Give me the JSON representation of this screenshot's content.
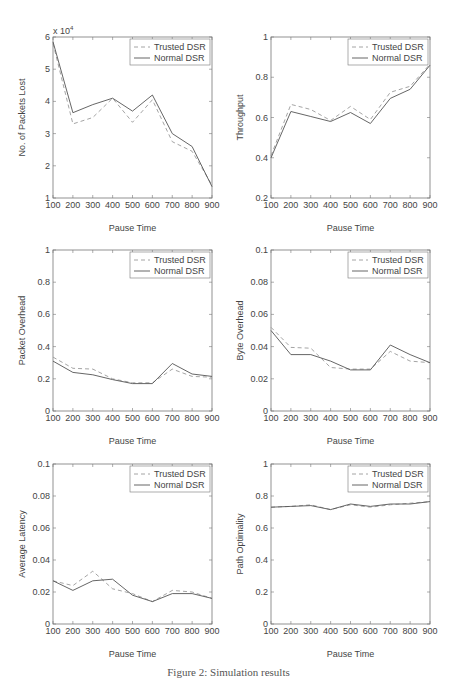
{
  "figure": {
    "caption": "Figure 2: Simulation results"
  },
  "legend": {
    "trusted": "Trusted DSR",
    "normal": "Normal DSR"
  },
  "colors": {
    "trusted": "#9a9a9a",
    "normal": "#555555",
    "axis": "#777777"
  },
  "chart_data": [
    {
      "type": "line",
      "title": "",
      "xlabel": "Pause Time",
      "ylabel": "No. of Packets Lost",
      "y_multiplier_label": "x 10^4",
      "x": [
        100,
        200,
        300,
        400,
        500,
        600,
        700,
        800,
        900
      ],
      "xticks": [
        "100",
        "200",
        "300",
        "400",
        "500",
        "600",
        "700",
        "800",
        "900"
      ],
      "yticks": [
        "1",
        "2",
        "3",
        "4",
        "5",
        "6"
      ],
      "ylim": [
        1,
        6
      ],
      "grid": false,
      "legend_position": "upper right",
      "series": [
        {
          "name": "Trusted DSR",
          "style": "dashed",
          "values": [
            5.8,
            3.3,
            3.5,
            4.1,
            3.35,
            4.05,
            2.75,
            2.45,
            1.4
          ]
        },
        {
          "name": "Normal DSR",
          "style": "solid",
          "values": [
            5.85,
            3.65,
            3.9,
            4.1,
            3.7,
            4.2,
            3.0,
            2.6,
            1.35
          ]
        }
      ]
    },
    {
      "type": "line",
      "title": "",
      "xlabel": "Pause Time",
      "ylabel": "Throughput",
      "x": [
        100,
        200,
        300,
        400,
        500,
        600,
        700,
        800,
        900
      ],
      "xticks": [
        "100",
        "200",
        "300",
        "400",
        "500",
        "600",
        "700",
        "800",
        "900"
      ],
      "yticks": [
        "0.2",
        "0.4",
        "0.6",
        "0.8",
        "1"
      ],
      "ylim": [
        0.2,
        1
      ],
      "grid": false,
      "legend_position": "upper right",
      "series": [
        {
          "name": "Trusted DSR",
          "style": "dashed",
          "values": [
            0.41,
            0.665,
            0.64,
            0.585,
            0.655,
            0.59,
            0.725,
            0.755,
            0.865
          ]
        },
        {
          "name": "Normal DSR",
          "style": "solid",
          "values": [
            0.4,
            0.63,
            0.605,
            0.58,
            0.625,
            0.57,
            0.695,
            0.74,
            0.86
          ]
        }
      ]
    },
    {
      "type": "line",
      "title": "",
      "xlabel": "Pause Time",
      "ylabel": "Packet Overhead",
      "x": [
        100,
        200,
        300,
        400,
        500,
        600,
        700,
        800,
        900
      ],
      "xticks": [
        "100",
        "200",
        "300",
        "400",
        "500",
        "600",
        "700",
        "800",
        "900"
      ],
      "yticks": [
        "0",
        "0.2",
        "0.4",
        "0.6",
        "0.8",
        "1"
      ],
      "ylim": [
        0,
        1
      ],
      "grid": false,
      "legend_position": "upper right",
      "series": [
        {
          "name": "Trusted DSR",
          "style": "dashed",
          "values": [
            0.335,
            0.265,
            0.26,
            0.2,
            0.175,
            0.175,
            0.26,
            0.215,
            0.21
          ]
        },
        {
          "name": "Normal DSR",
          "style": "solid",
          "values": [
            0.31,
            0.24,
            0.225,
            0.195,
            0.17,
            0.17,
            0.295,
            0.23,
            0.215
          ]
        }
      ]
    },
    {
      "type": "line",
      "title": "",
      "xlabel": "Pause Time",
      "ylabel": "Byte Overhead",
      "x": [
        100,
        200,
        300,
        400,
        500,
        600,
        700,
        800,
        900
      ],
      "xticks": [
        "100",
        "200",
        "300",
        "400",
        "500",
        "600",
        "700",
        "800",
        "900"
      ],
      "yticks": [
        "0",
        "0.02",
        "0.04",
        "0.06",
        "0.08",
        "0.1"
      ],
      "ylim": [
        0,
        0.1
      ],
      "grid": false,
      "legend_position": "upper right",
      "series": [
        {
          "name": "Trusted DSR",
          "style": "dashed",
          "values": [
            0.052,
            0.0395,
            0.039,
            0.027,
            0.026,
            0.026,
            0.037,
            0.031,
            0.03
          ]
        },
        {
          "name": "Normal DSR",
          "style": "solid",
          "values": [
            0.05,
            0.035,
            0.035,
            0.031,
            0.0255,
            0.0255,
            0.041,
            0.035,
            0.03
          ]
        }
      ]
    },
    {
      "type": "line",
      "title": "",
      "xlabel": "Pause Time",
      "ylabel": "Average Latency",
      "x": [
        100,
        200,
        300,
        400,
        500,
        600,
        700,
        800,
        900
      ],
      "xticks": [
        "100",
        "200",
        "300",
        "400",
        "500",
        "600",
        "700",
        "800",
        "900"
      ],
      "yticks": [
        "0",
        "0.02",
        "0.04",
        "0.06",
        "0.08",
        "0.1"
      ],
      "ylim": [
        0,
        0.1
      ],
      "grid": false,
      "legend_position": "upper right",
      "series": [
        {
          "name": "Trusted DSR",
          "style": "dashed",
          "values": [
            0.027,
            0.024,
            0.033,
            0.022,
            0.019,
            0.014,
            0.021,
            0.02,
            0.016
          ]
        },
        {
          "name": "Normal DSR",
          "style": "solid",
          "values": [
            0.027,
            0.021,
            0.027,
            0.028,
            0.018,
            0.014,
            0.019,
            0.019,
            0.016
          ]
        }
      ]
    },
    {
      "type": "line",
      "title": "",
      "xlabel": "Pause Time",
      "ylabel": "Path Optimality",
      "x": [
        100,
        200,
        300,
        400,
        500,
        600,
        700,
        800,
        900
      ],
      "xticks": [
        "100",
        "200",
        "300",
        "400",
        "500",
        "600",
        "700",
        "800",
        "900"
      ],
      "yticks": [
        "0",
        "0.2",
        "0.4",
        "0.6",
        "0.8",
        "1"
      ],
      "ylim": [
        0,
        1
      ],
      "grid": false,
      "legend_position": "upper right",
      "series": [
        {
          "name": "Trusted DSR",
          "style": "dashed",
          "values": [
            0.73,
            0.735,
            0.745,
            0.715,
            0.745,
            0.73,
            0.745,
            0.755,
            0.765
          ]
        },
        {
          "name": "Normal DSR",
          "style": "solid",
          "values": [
            0.73,
            0.735,
            0.74,
            0.715,
            0.75,
            0.735,
            0.75,
            0.75,
            0.765
          ]
        }
      ]
    }
  ]
}
